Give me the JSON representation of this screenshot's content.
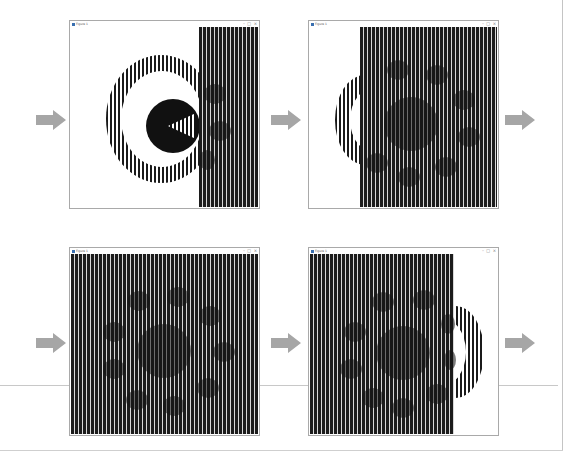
{
  "layout": {
    "description": "Four animation frames shown as application windows with arrows between them"
  },
  "windows": [
    {
      "title": "Figure 1",
      "controls": [
        "–",
        "□",
        "×"
      ],
      "frame": 1,
      "stripe_coverage": "right third"
    },
    {
      "title": "Figure 1",
      "controls": [
        "–",
        "□",
        "×"
      ],
      "frame": 2,
      "stripe_coverage": "right three-quarters"
    },
    {
      "title": "Figure 1",
      "controls": [
        "–",
        "□",
        "×"
      ],
      "frame": 3,
      "stripe_coverage": "full"
    },
    {
      "title": "Figure 1",
      "controls": [
        "–",
        "□",
        "×"
      ],
      "frame": 4,
      "stripe_coverage": "left three-quarters"
    }
  ],
  "arrows": [
    {
      "icon": "right-arrow-icon",
      "row": 1,
      "position": "left"
    },
    {
      "icon": "right-arrow-icon",
      "row": 1,
      "position": "middle"
    },
    {
      "icon": "right-arrow-icon",
      "row": 1,
      "position": "right"
    },
    {
      "icon": "right-arrow-icon",
      "row": 2,
      "position": "left"
    },
    {
      "icon": "right-arrow-icon",
      "row": 2,
      "position": "middle"
    },
    {
      "icon": "right-arrow-icon",
      "row": 2,
      "position": "right"
    }
  ],
  "colors": {
    "arrow": "#a6a6a6",
    "stripe_dark": "#1c1c1c",
    "stripe_light": "#d8d8d8",
    "window_border": "#a9a9a9",
    "divider": "#c8c8c8"
  }
}
